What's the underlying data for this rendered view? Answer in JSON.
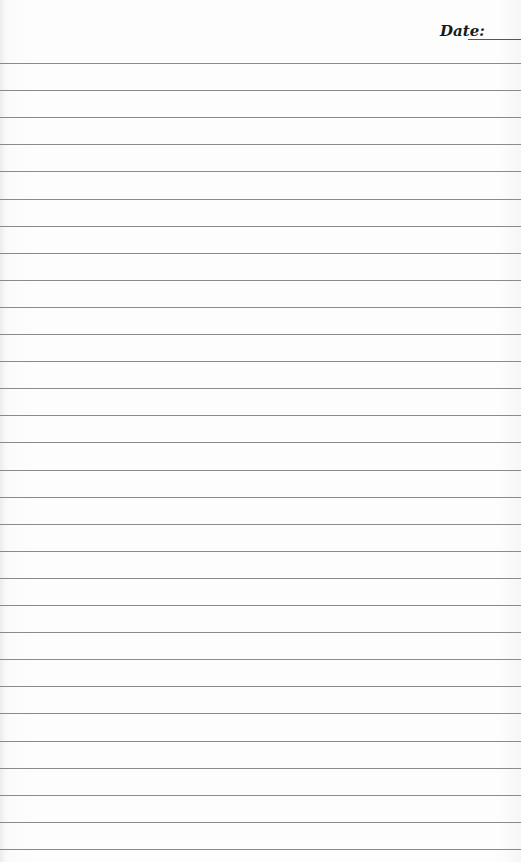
{
  "header": {
    "date_label": "Date:",
    "date_value": ""
  },
  "ruled_lines": {
    "count": 30,
    "first_y": 63,
    "spacing": 27.1,
    "color": "#8a8a8a"
  }
}
